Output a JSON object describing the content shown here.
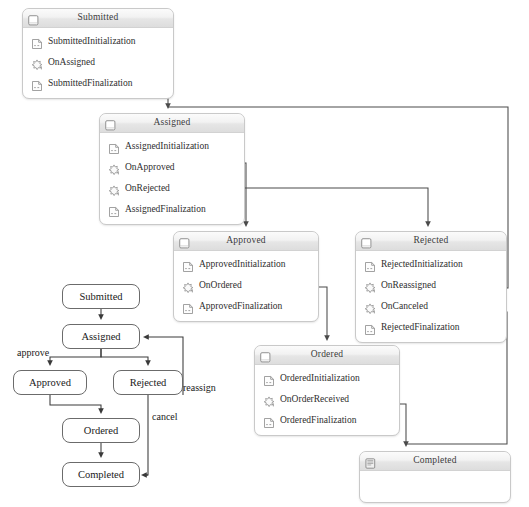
{
  "canvas": {
    "width": 529,
    "height": 507,
    "background": "#ffffff"
  },
  "theme": {
    "box_border": "#c9c9c9",
    "header_gradient_top": "#fbfbfb",
    "header_gradient_bottom": "#dddddd",
    "wire_color": "#4a4a4a",
    "state_border": "#6b6b6b",
    "text_color": "#2e2e2e"
  },
  "activities": [
    {
      "id": "submitted",
      "title": "Submitted",
      "header_icon": "state-activity-icon",
      "x": 22,
      "y": 8,
      "w": 152,
      "rows": [
        {
          "label": "SubmittedInitialization",
          "icon": "code-activity-icon"
        },
        {
          "label": "OnAssigned",
          "icon": "event-driven-activity-icon",
          "port": true
        },
        {
          "label": "SubmittedFinalization",
          "icon": "code-activity-icon"
        }
      ]
    },
    {
      "id": "assigned",
      "title": "Assigned",
      "header_icon": "state-activity-icon",
      "x": 99,
      "y": 113,
      "w": 146,
      "rows": [
        {
          "label": "AssignedInitialization",
          "icon": "code-activity-icon"
        },
        {
          "label": "OnApproved",
          "icon": "event-driven-activity-icon",
          "port": true
        },
        {
          "label": "OnRejected",
          "icon": "event-driven-activity-icon",
          "port": true
        },
        {
          "label": "AssignedFinalization",
          "icon": "code-activity-icon"
        }
      ]
    },
    {
      "id": "approved",
      "title": "Approved",
      "header_icon": "state-activity-icon",
      "x": 173,
      "y": 231,
      "w": 146,
      "rows": [
        {
          "label": "ApprovedInitialization",
          "icon": "code-activity-icon"
        },
        {
          "label": "OnOrdered",
          "icon": "event-driven-activity-icon",
          "port": true
        },
        {
          "label": "ApprovedFinalization",
          "icon": "code-activity-icon"
        }
      ]
    },
    {
      "id": "rejected",
      "title": "Rejected",
      "header_icon": "state-activity-icon",
      "x": 355,
      "y": 231,
      "w": 152,
      "rows": [
        {
          "label": "RejectedInitialization",
          "icon": "code-activity-icon"
        },
        {
          "label": "OnReassigned",
          "icon": "event-driven-activity-icon",
          "port": true
        },
        {
          "label": "OnCanceled",
          "icon": "event-driven-activity-icon",
          "port": true
        },
        {
          "label": "RejectedFinalization",
          "icon": "code-activity-icon"
        }
      ]
    },
    {
      "id": "ordered",
      "title": "Ordered",
      "header_icon": "state-activity-icon",
      "x": 254,
      "y": 345,
      "w": 146,
      "rows": [
        {
          "label": "OrderedInitialization",
          "icon": "code-activity-icon"
        },
        {
          "label": "OnOrderReceived",
          "icon": "event-driven-activity-icon",
          "port": true
        },
        {
          "label": "OrderedFinalization",
          "icon": "code-activity-icon"
        }
      ]
    },
    {
      "id": "completed",
      "title": "Completed",
      "header_icon": "completed-state-icon",
      "x": 359,
      "y": 451,
      "w": 152,
      "rows": []
    }
  ],
  "state_machine": {
    "states": [
      {
        "id": "sm-submitted",
        "label": "Submitted",
        "x": 62,
        "y": 9,
        "w": 78,
        "h": 25
      },
      {
        "id": "sm-assigned",
        "label": "Assigned",
        "x": 62,
        "y": 49,
        "w": 78,
        "h": 25
      },
      {
        "id": "sm-approved",
        "label": "Approved",
        "x": 13,
        "y": 95,
        "w": 74,
        "h": 25
      },
      {
        "id": "sm-rejected",
        "label": "Rejected",
        "x": 113,
        "y": 95,
        "w": 70,
        "h": 25
      },
      {
        "id": "sm-ordered",
        "label": "Ordered",
        "x": 62,
        "y": 143,
        "w": 78,
        "h": 25
      },
      {
        "id": "sm-completed",
        "label": "Completed",
        "x": 62,
        "y": 187,
        "w": 78,
        "h": 25
      }
    ],
    "edge_labels": [
      {
        "id": "edge-approve",
        "text": "approve",
        "x": 17,
        "y": 347
      },
      {
        "id": "edge-reassign",
        "text": "reassign",
        "x": 183,
        "y": 382
      },
      {
        "id": "edge-cancel",
        "text": "cancel",
        "x": 152,
        "y": 411
      }
    ]
  },
  "connectors": [
    {
      "id": "wire-onassigned-to-assigned",
      "from": "OnAssigned",
      "to": "Assigned"
    },
    {
      "id": "wire-onapproved-to-approved",
      "from": "OnApproved",
      "to": "Approved"
    },
    {
      "id": "wire-onrejected-to-rejected",
      "from": "OnRejected",
      "to": "Rejected"
    },
    {
      "id": "wire-onordered-to-ordered",
      "from": "OnOrdered",
      "to": "Ordered"
    },
    {
      "id": "wire-onreassigned-to-assigned",
      "from": "OnReassigned",
      "to": "Assigned"
    },
    {
      "id": "wire-oncanceled-to-completed",
      "from": "OnCanceled",
      "to": "Completed"
    },
    {
      "id": "wire-onorderreceived-to-completed",
      "from": "OnOrderReceived",
      "to": "Completed"
    }
  ]
}
